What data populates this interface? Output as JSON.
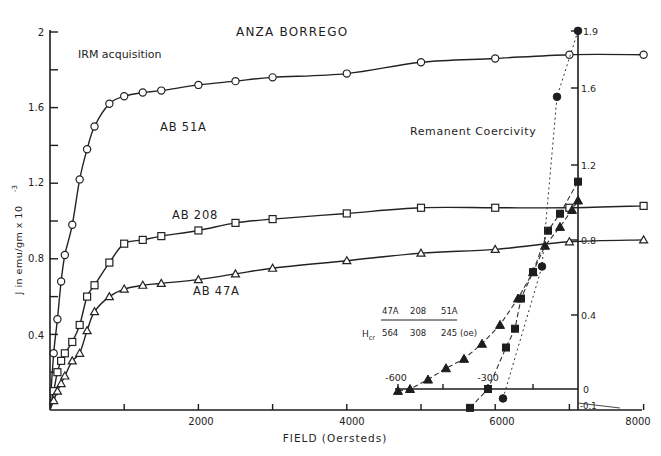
{
  "chart_data": [
    {
      "id": "irm_acquisition",
      "type": "line",
      "title": "ANZA BORREGO",
      "subtitle": "IRM acquisition",
      "xlabel": "FIELD (Oersteds)",
      "ylabel": "J in emu/gm x 10^-3",
      "xlim": [
        0,
        8000
      ],
      "ylim": [
        0,
        2.0
      ],
      "x_ticks": [
        1000,
        2000,
        3000,
        4000,
        5000,
        6000,
        7000,
        8000
      ],
      "x_tick_labels": [
        "2000",
        "4000",
        "6000",
        "8000"
      ],
      "y_ticks": [
        0.2,
        0.4,
        0.6,
        0.8,
        1.0,
        1.2,
        1.4,
        1.6,
        1.8,
        2.0
      ],
      "y_tick_labels": [
        "0.4",
        "0.8",
        "1.2",
        "1.6",
        "2"
      ],
      "grid": false,
      "series": [
        {
          "name": "AB 51A",
          "marker": "open-circle",
          "x": [
            0,
            50,
            100,
            150,
            200,
            300,
            400,
            500,
            600,
            800,
            1000,
            1250,
            1500,
            2000,
            2500,
            3000,
            4000,
            5000,
            6000,
            7000,
            8000
          ],
          "y": [
            0.02,
            0.3,
            0.48,
            0.68,
            0.82,
            0.98,
            1.22,
            1.38,
            1.5,
            1.62,
            1.66,
            1.68,
            1.69,
            1.72,
            1.74,
            1.76,
            1.78,
            1.84,
            1.86,
            1.88,
            1.88
          ]
        },
        {
          "name": "AB 208",
          "marker": "open-square",
          "x": [
            0,
            50,
            100,
            150,
            200,
            300,
            400,
            500,
            600,
            800,
            1000,
            1250,
            1500,
            2000,
            2500,
            3000,
            4000,
            5000,
            6000,
            7000,
            8000
          ],
          "y": [
            0.01,
            0.1,
            0.2,
            0.26,
            0.3,
            0.36,
            0.45,
            0.6,
            0.66,
            0.78,
            0.88,
            0.9,
            0.92,
            0.95,
            0.99,
            1.01,
            1.04,
            1.07,
            1.07,
            1.07,
            1.08
          ]
        },
        {
          "name": "AB 47A",
          "marker": "open-triangle",
          "x": [
            0,
            50,
            100,
            150,
            200,
            300,
            400,
            500,
            600,
            800,
            1000,
            1250,
            1500,
            2000,
            2500,
            3000,
            4000,
            5000,
            6000,
            7000,
            8000
          ],
          "y": [
            0.0,
            0.05,
            0.1,
            0.14,
            0.18,
            0.26,
            0.3,
            0.42,
            0.52,
            0.6,
            0.64,
            0.66,
            0.67,
            0.69,
            0.72,
            0.75,
            0.79,
            0.83,
            0.85,
            0.89,
            0.9
          ]
        }
      ],
      "annotations": [
        "AB 51A",
        "AB 208",
        "AB 47A"
      ]
    },
    {
      "id": "remanent_coercivity",
      "type": "line",
      "title": "Remanent Coercivity",
      "xlabel": "back field (Oe)",
      "ylabel": "",
      "xlim": [
        -600,
        0
      ],
      "ylim": [
        -0.1,
        1.9
      ],
      "x_tick_labels": [
        "-600",
        "-300"
      ],
      "y_tick_labels": [
        "1.9",
        "1.6",
        "1.2",
        "0.8",
        "0.4",
        "0",
        "-0.1"
      ],
      "grid": false,
      "series": [
        {
          "name": "47A",
          "marker": "filled-triangle",
          "Hcr": 564,
          "x": [
            -600,
            -560,
            -500,
            -440,
            -380,
            -320,
            -260,
            -200,
            -150,
            -110,
            -60,
            -20,
            0
          ],
          "y": [
            -0.01,
            0.0,
            0.05,
            0.11,
            0.16,
            0.24,
            0.34,
            0.48,
            0.62,
            0.76,
            0.86,
            0.95,
            1.0
          ]
        },
        {
          "name": "208",
          "marker": "filled-square",
          "Hcr": 308,
          "x": [
            -360,
            -300,
            -240,
            -210,
            -190,
            -150,
            -100,
            -60,
            0
          ],
          "y": [
            -0.1,
            0.0,
            0.22,
            0.32,
            0.48,
            0.62,
            0.84,
            0.93,
            1.1
          ]
        },
        {
          "name": "51A",
          "marker": "filled-circle",
          "Hcr": 245,
          "x": [
            -250,
            -120,
            -70,
            0
          ],
          "y": [
            -0.05,
            0.65,
            1.55,
            1.9
          ]
        }
      ],
      "legend": {
        "headers": [
          "47A",
          "208",
          "51A"
        ],
        "row_label": "Hcr",
        "values": [
          "564",
          "308",
          "245 (oe)"
        ]
      }
    }
  ],
  "labels": {
    "title": "ANZA BORREGO",
    "subtitle": "IRM acquisition",
    "inset_title": "Remanent Coercivity",
    "xlabel": "FIELD (Oersteds)",
    "ylabel": "J in emu/gm x 10",
    "ylabel_exp": "-3",
    "series_51a": "AB 51A",
    "series_208": "AB 208",
    "series_47a": "AB 47A",
    "legend_h1": "47A",
    "legend_h2": "208",
    "legend_h3": "51A",
    "legend_row": "H",
    "legend_row_sub": "cr",
    "legend_v1": "564",
    "legend_v2": "308",
    "legend_v3": "245 (oe)",
    "yl_2": "2",
    "yl_16": "1.6",
    "yl_12": "1.2",
    "yl_08": "0.8",
    "yl_04": "0.4",
    "xl_2000": "2000",
    "xl_4000": "4000",
    "xl_6000": "6000",
    "xl_8000": "8000",
    "yr_19": "1.9",
    "yr_16": "1.6",
    "yr_12": "1.2",
    "yr_08": "0.8",
    "yr_04": "0.4",
    "yr_0": "0",
    "yr_m01": "-0.1",
    "inset_x_m600": "-600",
    "inset_x_m300": "-300"
  }
}
